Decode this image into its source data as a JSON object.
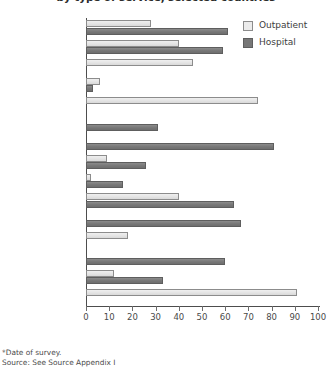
{
  "chart_data": {
    "type": "bar",
    "orientation": "horizontal",
    "title": "by type of service, selected countries",
    "xlabel": "",
    "ylabel": "",
    "xlim": [
      0,
      100
    ],
    "xticks": [
      0,
      10,
      20,
      30,
      40,
      50,
      60,
      70,
      80,
      90,
      100
    ],
    "grid": false,
    "legend_position": "top-right",
    "categories": [
      "Albania (2001)",
      "Armenia (2001)",
      "Bangladesh (2002)",
      "Bulgaria (2001)",
      "China (n.d.)",
      "Ghana (2000)",
      "Kazakhstan (1999)*",
      "Kazakhstan (2001)",
      "Kosovo (2000)",
      "Poland (2002)",
      "Romania (2000)",
      "Russia (2002)",
      "Slovakia (2000)",
      "Tajikistan (1999)",
      "Uganda (2003)"
    ],
    "series": [
      {
        "name": "Outpatient",
        "color": "#e4e4e4",
        "values": [
          28,
          40,
          46,
          6,
          74,
          0,
          0,
          9,
          2,
          40,
          0,
          18,
          0,
          12,
          91
        ]
      },
      {
        "name": "Hospital",
        "color": "#777777",
        "values": [
          61,
          59,
          0,
          3,
          0,
          31,
          81,
          26,
          16,
          64,
          67,
          0,
          60,
          33,
          0
        ]
      }
    ],
    "annotations": [
      "*Date of survey.",
      "Source: See Source Appendix I"
    ]
  },
  "legend": {
    "items": [
      {
        "label": "Outpatient",
        "swatch": "outpatient-swatch"
      },
      {
        "label": "Hospital",
        "swatch": "hospital-swatch"
      }
    ]
  },
  "footnotes": {
    "date_note": "*Date of survey.",
    "source_note": "Source: See Source Appendix I"
  }
}
